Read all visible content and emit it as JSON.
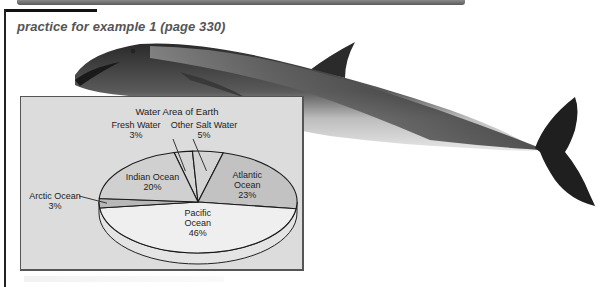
{
  "page": {
    "heading": "practice for example 1 (page 330)"
  },
  "chart_data": {
    "type": "pie",
    "title": "Water Area of Earth",
    "style": "3d-oval",
    "slices": [
      {
        "label": "Fresh Water",
        "value": 3,
        "display": "3%",
        "color": "#d4d4d4",
        "label_lines": [
          "Fresh Water",
          "3%"
        ],
        "label_position": "top-outside"
      },
      {
        "label": "Other Salt Water",
        "value": 5,
        "display": "5%",
        "color": "#d4d4d4",
        "label_lines": [
          "Other Salt Water",
          "5%"
        ],
        "label_position": "top-outside"
      },
      {
        "label": "Atlantic Ocean",
        "value": 23,
        "display": "23%",
        "color": "#c2c2c2",
        "label_lines": [
          "Atlantic",
          "Ocean",
          "23%"
        ],
        "label_position": "inside"
      },
      {
        "label": "Pacific Ocean",
        "value": 46,
        "display": "46%",
        "color": "#efefef",
        "label_lines": [
          "Pacific",
          "Ocean",
          "46%"
        ],
        "label_position": "inside"
      },
      {
        "label": "Arctic Ocean",
        "value": 3,
        "display": "3%",
        "color": "#b8b8b8",
        "label_lines": [
          "Arctic Ocean",
          "3%"
        ],
        "label_position": "left-outside"
      },
      {
        "label": "Indian Ocean",
        "value": 20,
        "display": "20%",
        "color": "#d0d0d0",
        "label_lines": [
          "Indian Ocean",
          "20%"
        ],
        "label_position": "inside"
      }
    ],
    "legend": "none"
  }
}
